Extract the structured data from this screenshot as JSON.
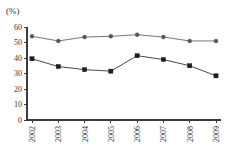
{
  "unit_label": "(%)",
  "chart_data": {
    "type": "line",
    "title": "",
    "subtitle": "",
    "xlabel": "",
    "ylabel": "(%)",
    "unit": "%",
    "grid": false,
    "legend": "none",
    "categories": [
      "2002",
      "2003",
      "2004",
      "2005",
      "2006",
      "2007",
      "2008",
      "2009"
    ],
    "x": [
      2002,
      2003,
      2004,
      2005,
      2006,
      2007,
      2008,
      2009
    ],
    "ylim": [
      0,
      60
    ],
    "yticks": [
      0,
      10,
      20,
      30,
      40,
      50,
      60
    ],
    "ytick_labels": [
      "0",
      "10",
      "20",
      "30",
      "40",
      "50",
      "60"
    ],
    "xtick_labels": [
      "2002",
      "2003",
      "2004",
      "2005",
      "2006",
      "2007",
      "2008",
      "2009"
    ],
    "xtick_rotation": -90,
    "series": [
      {
        "name": "upper-series",
        "marker": "circle",
        "color": "#555555",
        "values": [
          54,
          51,
          53.5,
          54,
          55,
          53.5,
          51,
          51
        ]
      },
      {
        "name": "lower-series",
        "marker": "square",
        "color": "#1c1c1c",
        "values": [
          39.5,
          34.5,
          32.5,
          31.5,
          41.5,
          39,
          35,
          28.5
        ]
      }
    ]
  },
  "colors": {
    "axis": "#3a3a3a",
    "series_a": "#555555",
    "series_b": "#1c1c1c",
    "background": "#ffffff"
  }
}
